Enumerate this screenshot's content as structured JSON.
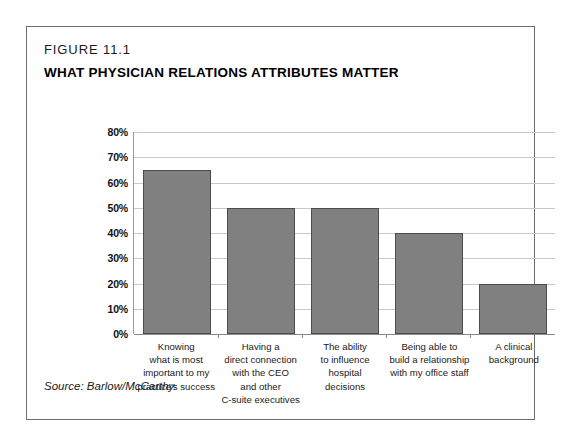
{
  "figure": {
    "number": "FIGURE 11.1",
    "title": "WHAT PHYSICIAN RELATIONS ATTRIBUTES MATTER",
    "source": "Source: Barlow/McCarthy."
  },
  "colors": {
    "bar_fill": "#808080",
    "bar_border": "#4d4d4d",
    "gridline": "#c9c9c9",
    "axis": "#8a8a8a",
    "frame": "#6e6e6e"
  },
  "chart_data": {
    "type": "bar",
    "title": "WHAT PHYSICIAN RELATIONS ATTRIBUTES MATTER",
    "xlabel": "",
    "ylabel": "",
    "ylim": [
      0,
      80
    ],
    "ytick_labels": [
      "80%",
      "70%",
      "60%",
      "50%",
      "40%",
      "30%",
      "20%",
      "10%",
      "0%"
    ],
    "ytick_values": [
      80,
      70,
      60,
      50,
      40,
      30,
      20,
      10,
      0
    ],
    "grid": true,
    "legend": "none",
    "categories": [
      "Knowing what is most important to my practice's success",
      "Having a direct connection with the CEO and other C-suite executives",
      "The ability to influence hospital decisions",
      "Being able to build a relationship with my office staff",
      "A clinical background"
    ],
    "category_lines": [
      [
        "Knowing",
        "what is most",
        "important to my",
        "practice's success"
      ],
      [
        "Having a",
        "direct connection",
        "with the CEO",
        "and other",
        "C-suite executives"
      ],
      [
        "The ability",
        "to influence",
        "hospital",
        "decisions"
      ],
      [
        "Being able to",
        "build a relationship",
        "with my office staff"
      ],
      [
        "A clinical",
        "background"
      ]
    ],
    "values": [
      65,
      50,
      50,
      40,
      20
    ]
  }
}
